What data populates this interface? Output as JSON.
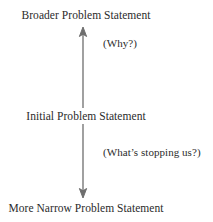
{
  "diagram": {
    "background_color": "#ffffff",
    "text_color": "#2b2b2b",
    "arrow_color": "#6e6e6e",
    "nodes": [
      {
        "id": "broader",
        "label": "Broader Problem Statement",
        "position": "top"
      },
      {
        "id": "initial",
        "label": "Initial Problem Statement",
        "position": "middle"
      },
      {
        "id": "narrow",
        "label": "More Narrow Problem Statement",
        "position": "bottom"
      }
    ],
    "annotations": [
      {
        "id": "why",
        "label": "(Why?)",
        "side": "right",
        "segment": "upward"
      },
      {
        "id": "stopping",
        "label": "(What’s stopping us?)",
        "side": "right",
        "segment": "downward"
      }
    ],
    "connector": {
      "type": "double-headed-vertical-arrow",
      "head_top": "up-arrowhead",
      "head_bottom": "down-arrowhead",
      "gap_at": "initial"
    }
  }
}
